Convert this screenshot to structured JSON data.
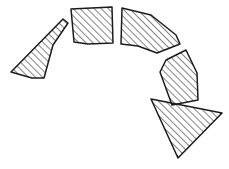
{
  "figure": {
    "canvas": {
      "width": 229,
      "height": 169,
      "background": "#ffffff"
    },
    "style": {
      "outline_color": "#1c1c1c",
      "outline_width": 1.5,
      "hatch_color": "#1c1c1c",
      "hatch_angle_deg": 45,
      "hatch_spacing_px": 5,
      "hatch_line_width": 1.1,
      "fill": "none"
    },
    "ring": {
      "center_x": 110,
      "center_y": 74,
      "inner_radius": 48,
      "outer_radius": 76,
      "span_start_deg": 200,
      "span_end_deg": 18,
      "segment_count": 4
    },
    "shapes": [
      {
        "id": "arc-segment-1",
        "kind": "annular-sector",
        "label": "upper-left long wedge",
        "path": "M 63,19 L 68,23 L 53,45 L 44,78 L 32,78 L 11,72 Z",
        "hatched": true
      },
      {
        "id": "arc-segment-2",
        "kind": "annular-sector",
        "label": "top-left quadrilateral",
        "path": "M 71,9 L 112,7 L 113,43 L 88,44 L 74,42 Z",
        "hatched": true
      },
      {
        "id": "arc-segment-3",
        "kind": "annular-sector",
        "label": "top-right wedge",
        "path": "M 122,8 L 151,15 L 176,35 L 180,44 L 157,53 L 138,46 L 121,44 Z",
        "hatched": true
      },
      {
        "id": "arc-segment-4",
        "kind": "annular-sector",
        "label": "right wedge",
        "path": "M 186,50 L 197,73 L 198,100 L 172,105 L 160,72 L 166,60 Z",
        "hatched": true
      },
      {
        "id": "triangle-1",
        "kind": "triangle",
        "label": "detached lower-right triangle",
        "path": "M 151,99 L 222,113 L 178,158 Z",
        "hatched": true
      }
    ]
  }
}
